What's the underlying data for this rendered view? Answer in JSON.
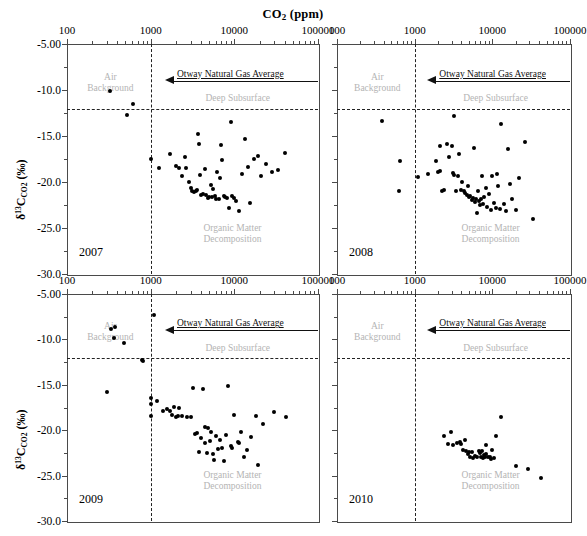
{
  "chart_data": {
    "type": "scatter",
    "title": "CO2 (ppm)",
    "title_html": "CO<sub>2</sub> (ppm)",
    "xlabel": "CO2 (ppm)",
    "ylabel": "d13C_CO2 (per mil)",
    "ylabel_html": "&delta;<sup>13</sup>C<sub>CO2</sub> (&permil;)",
    "x_scale": "log",
    "xlim": [
      100,
      100000
    ],
    "ylim": [
      -30.0,
      -5.0
    ],
    "xticks": [
      100,
      1000,
      10000,
      100000
    ],
    "xticklabels": [
      "100",
      "1000",
      "10000",
      "100000"
    ],
    "yticks": [
      -5.0,
      -10.0,
      -15.0,
      -20.0,
      -25.0,
      -30.0
    ],
    "yticklabels": [
      "-5.00",
      "-10.0",
      "-15.0",
      "-20.0",
      "-25.0",
      "-30.0"
    ],
    "grid": false,
    "legend": "none",
    "marker": "filled-circle",
    "marker_color": "#000000",
    "annotation_color": "#b4b4b4",
    "reference_lines": [
      {
        "name": "co2-1000ppm-vline",
        "orient": "vertical",
        "value": 1000,
        "style": "dashed"
      },
      {
        "name": "deep-subsurface-hline",
        "orient": "horizontal",
        "value": -12.1,
        "style": "dashed"
      }
    ],
    "annotations": [
      {
        "name": "air-background",
        "text": "Air\nBackground",
        "line1": "Air",
        "line2": "Background",
        "x": 330,
        "y": -9.2
      },
      {
        "name": "deep-subsurface",
        "text": "Deep Subsurface",
        "x": 11000,
        "y": -10.9
      },
      {
        "name": "organic-matter-decomposition",
        "text": "Organic Matter\nDecomposition",
        "line1": "Organic Matter",
        "line2": "Decomposition",
        "x": 9500,
        "y": -25.6
      },
      {
        "name": "otway-natural-gas-average",
        "text": "Otway Natural Gas Average",
        "y": -9.0,
        "arrow_to_x": 1900,
        "arrow_dir": "left"
      }
    ],
    "panels": [
      {
        "name": "panel-2007",
        "year": "2007",
        "series_name": "2007",
        "points": [
          [
            330,
            -10.1
          ],
          [
            520,
            -12.7
          ],
          [
            610,
            -11.5
          ],
          [
            1000,
            -17.5
          ],
          [
            1250,
            -18.5
          ],
          [
            1700,
            -17.0
          ],
          [
            2000,
            -18.3
          ],
          [
            2200,
            -18.5
          ],
          [
            2400,
            -19.3
          ],
          [
            2600,
            -17.3
          ],
          [
            2650,
            -18.5
          ],
          [
            2900,
            -20.0
          ],
          [
            3050,
            -20.7
          ],
          [
            3150,
            -21.0
          ],
          [
            3300,
            -21.1
          ],
          [
            3500,
            -21.0
          ],
          [
            3600,
            -20.9
          ],
          [
            3700,
            -14.8
          ],
          [
            3750,
            -15.9
          ],
          [
            3900,
            -19.2
          ],
          [
            4000,
            -21.4
          ],
          [
            4200,
            -21.3
          ],
          [
            4400,
            -18.6
          ],
          [
            4600,
            -21.4
          ],
          [
            4800,
            -21.7
          ],
          [
            5000,
            -21.6
          ],
          [
            5200,
            -20.3
          ],
          [
            5400,
            -21.6
          ],
          [
            5600,
            -20.8
          ],
          [
            5800,
            -21.5
          ],
          [
            6000,
            -21.8
          ],
          [
            6200,
            -18.9
          ],
          [
            6500,
            -21.8
          ],
          [
            6800,
            -19.6
          ],
          [
            7000,
            -16.0
          ],
          [
            7200,
            -17.6
          ],
          [
            7500,
            -21.5
          ],
          [
            7800,
            -21.6
          ],
          [
            8200,
            -21.7
          ],
          [
            8600,
            -22.8
          ],
          [
            9000,
            -13.5
          ],
          [
            9400,
            -21.5
          ],
          [
            9800,
            -21.7
          ],
          [
            10500,
            -22.1
          ],
          [
            11500,
            -23.1
          ],
          [
            12500,
            -19.1
          ],
          [
            13500,
            -15.3
          ],
          [
            14500,
            -18.4
          ],
          [
            15500,
            -22.3
          ],
          [
            17000,
            -17.5
          ],
          [
            19000,
            -17.2
          ],
          [
            21000,
            -19.4
          ],
          [
            24000,
            -18.0
          ],
          [
            28000,
            -18.9
          ],
          [
            33000,
            -18.7
          ],
          [
            40000,
            -16.9
          ]
        ]
      },
      {
        "name": "panel-2008",
        "year": "2008",
        "series_name": "2008",
        "points": [
          [
            380,
            -13.4
          ],
          [
            650,
            -17.7
          ],
          [
            620,
            -21.0
          ],
          [
            1100,
            -19.5
          ],
          [
            1500,
            -19.1
          ],
          [
            1900,
            -17.7
          ],
          [
            2000,
            -18.9
          ],
          [
            2100,
            -16.1
          ],
          [
            2150,
            -18.8
          ],
          [
            2250,
            -21.0
          ],
          [
            2400,
            -20.9
          ],
          [
            2600,
            -15.9
          ],
          [
            2750,
            -17.3
          ],
          [
            3000,
            -16.1
          ],
          [
            3100,
            -19.0
          ],
          [
            3200,
            -12.8
          ],
          [
            3250,
            -19.2
          ],
          [
            3400,
            -21.0
          ],
          [
            3600,
            -19.4
          ],
          [
            3700,
            -17.0
          ],
          [
            3900,
            -20.9
          ],
          [
            4100,
            -20.0
          ],
          [
            4300,
            -21.0
          ],
          [
            4500,
            -21.2
          ],
          [
            4700,
            -21.4
          ],
          [
            4800,
            -20.4
          ],
          [
            5000,
            -21.6
          ],
          [
            5200,
            -21.5
          ],
          [
            5400,
            -22.0
          ],
          [
            5600,
            -21.7
          ],
          [
            5800,
            -16.3
          ],
          [
            6000,
            -22.2
          ],
          [
            6200,
            -21.9
          ],
          [
            6400,
            -23.4
          ],
          [
            6600,
            -21.0
          ],
          [
            6800,
            -22.1
          ],
          [
            7000,
            -22.5
          ],
          [
            7200,
            -21.9
          ],
          [
            7400,
            -19.3
          ],
          [
            7600,
            -22.4
          ],
          [
            7800,
            -21.6
          ],
          [
            8200,
            -20.6
          ],
          [
            8600,
            -22.7
          ],
          [
            9000,
            -21.3
          ],
          [
            9500,
            -23.0
          ],
          [
            10000,
            -19.4
          ],
          [
            10500,
            -22.3
          ],
          [
            11000,
            -22.8
          ],
          [
            11500,
            -19.1
          ],
          [
            12000,
            -20.4
          ],
          [
            12500,
            -22.9
          ],
          [
            13000,
            -13.7
          ],
          [
            14000,
            -22.4
          ],
          [
            15000,
            -23.2
          ],
          [
            16000,
            -16.4
          ],
          [
            17000,
            -20.2
          ],
          [
            18000,
            -21.8
          ],
          [
            20000,
            -23.0
          ],
          [
            22000,
            -19.6
          ],
          [
            26000,
            -15.6
          ],
          [
            33000,
            -24.0
          ]
        ]
      },
      {
        "name": "panel-2009",
        "year": "2009",
        "series_name": "2009",
        "points": [
          [
            340,
            -8.9
          ],
          [
            360,
            -9.8
          ],
          [
            370,
            -8.6
          ],
          [
            480,
            -10.4
          ],
          [
            300,
            -15.8
          ],
          [
            780,
            -12.3
          ],
          [
            820,
            -12.4
          ],
          [
            1000,
            -16.5
          ],
          [
            1000,
            -18.4
          ],
          [
            1020,
            -17.1
          ],
          [
            1100,
            -7.3
          ],
          [
            1200,
            -16.8
          ],
          [
            1400,
            -17.9
          ],
          [
            1550,
            -17.7
          ],
          [
            1700,
            -17.9
          ],
          [
            1800,
            -18.3
          ],
          [
            1900,
            -17.4
          ],
          [
            2000,
            -18.5
          ],
          [
            2100,
            -18.4
          ],
          [
            2200,
            -17.6
          ],
          [
            2400,
            -18.4
          ],
          [
            2700,
            -18.5
          ],
          [
            3000,
            -18.5
          ],
          [
            3200,
            -15.3
          ],
          [
            3400,
            -20.4
          ],
          [
            3600,
            -20.3
          ],
          [
            3800,
            -22.4
          ],
          [
            4000,
            -20.9
          ],
          [
            4200,
            -15.5
          ],
          [
            4400,
            -19.6
          ],
          [
            4500,
            -21.4
          ],
          [
            4700,
            -22.5
          ],
          [
            4900,
            -19.8
          ],
          [
            5100,
            -21.2
          ],
          [
            5300,
            -20.2
          ],
          [
            5500,
            -22.6
          ],
          [
            5700,
            -23.3
          ],
          [
            6000,
            -20.6
          ],
          [
            6400,
            -22.1
          ],
          [
            6800,
            -21.1
          ],
          [
            7200,
            -22.0
          ],
          [
            7600,
            -23.4
          ],
          [
            8000,
            -20.5
          ],
          [
            8500,
            -15.1
          ],
          [
            9000,
            -21.7
          ],
          [
            9500,
            -22.0
          ],
          [
            10000,
            -18.3
          ],
          [
            11000,
            -21.3
          ],
          [
            11500,
            -21.4
          ],
          [
            12000,
            -20.2
          ],
          [
            13000,
            -22.9
          ],
          [
            14000,
            -22.2
          ],
          [
            16000,
            -20.8
          ],
          [
            18000,
            -18.4
          ],
          [
            19000,
            -23.8
          ],
          [
            22000,
            -19.3
          ],
          [
            30000,
            -18.0
          ],
          [
            42000,
            -18.6
          ]
        ]
      },
      {
        "name": "panel-2010",
        "year": "2010",
        "series_name": "2010",
        "points": [
          [
            2400,
            -20.6
          ],
          [
            2700,
            -21.5
          ],
          [
            2900,
            -20.2
          ],
          [
            3100,
            -21.6
          ],
          [
            3500,
            -21.4
          ],
          [
            3800,
            -21.3
          ],
          [
            4000,
            -21.5
          ],
          [
            4200,
            -22.2
          ],
          [
            4400,
            -21.1
          ],
          [
            4600,
            -22.3
          ],
          [
            4800,
            -22.6
          ],
          [
            5000,
            -22.4
          ],
          [
            5200,
            -22.9
          ],
          [
            5400,
            -22.4
          ],
          [
            5600,
            -23.1
          ],
          [
            6000,
            -22.8
          ],
          [
            6300,
            -23.0
          ],
          [
            6800,
            -22.3
          ],
          [
            7000,
            -22.5
          ],
          [
            7200,
            -22.9
          ],
          [
            7400,
            -22.3
          ],
          [
            7600,
            -23.1
          ],
          [
            7800,
            -22.7
          ],
          [
            8000,
            -23.0
          ],
          [
            8200,
            -21.6
          ],
          [
            8400,
            -22.6
          ],
          [
            8800,
            -23.0
          ],
          [
            9200,
            -22.9
          ],
          [
            9600,
            -23.2
          ],
          [
            10000,
            -22.2
          ],
          [
            10500,
            -23.1
          ],
          [
            11000,
            -20.6
          ],
          [
            13000,
            -18.5
          ],
          [
            20000,
            -23.9
          ],
          [
            29000,
            -24.3
          ],
          [
            42000,
            -25.3
          ]
        ]
      }
    ]
  }
}
